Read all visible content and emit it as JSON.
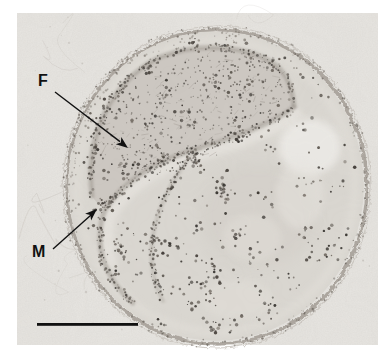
{
  "figure": {
    "kind": "transmission-electron-micrograph",
    "annotations": [
      {
        "id": "F",
        "label": "F"
      },
      {
        "id": "M",
        "label": "M"
      }
    ],
    "scale_bar": {
      "present": true,
      "text": ""
    },
    "palette": {
      "page_bg": "#ffffff",
      "photo_bg": "#e8e6e2",
      "cell_fill": "#dad7d1",
      "fibrillar_fill": "#cbc7c0",
      "membrane": "#8f8880",
      "rim": "#a29c94",
      "granule_dark": "#3a3530",
      "ink": "#111111"
    }
  }
}
